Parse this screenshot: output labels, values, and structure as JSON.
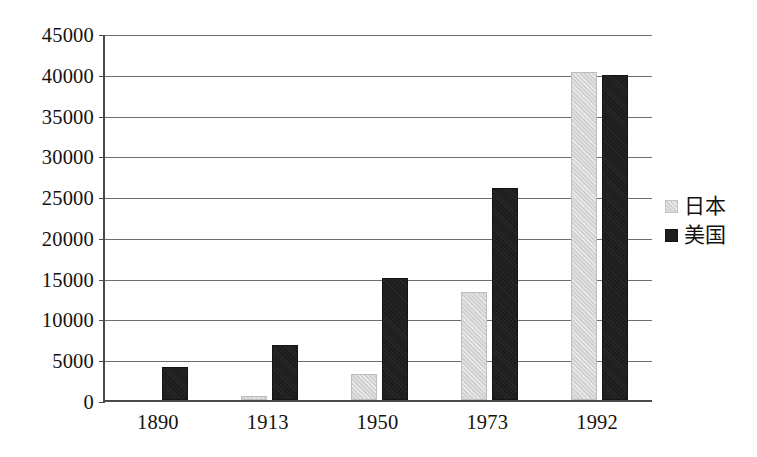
{
  "chart_data": {
    "type": "bar",
    "title": "",
    "subtitle": "",
    "xlabel": "",
    "ylabel": "",
    "categories": [
      "1890",
      "1913",
      "1950",
      "1973",
      "1992"
    ],
    "series": [
      {
        "name": "日本",
        "color": "#d2d2d2",
        "values": [
          0,
          500,
          3200,
          13300,
          40200
        ]
      },
      {
        "name": "美国",
        "color": "#1d1d1d",
        "values": [
          4000,
          6700,
          15000,
          26000,
          39800
        ]
      }
    ],
    "ylim": [
      0,
      45000
    ],
    "ytick_step": 5000,
    "yticks": [
      "0",
      "5000",
      "10000",
      "15000",
      "20000",
      "25000",
      "30000",
      "35000",
      "40000",
      "45000"
    ],
    "ytick_values": [
      0,
      5000,
      10000,
      15000,
      20000,
      25000,
      30000,
      35000,
      40000,
      45000
    ],
    "grid": true,
    "grid_axis": "y",
    "legend_position": "right",
    "background_color": "#ffffff",
    "axis_color": "#4a4a4a",
    "grid_color": "#6e6e6e"
  },
  "axes": {
    "y_labels": [
      "45000",
      "40000",
      "35000",
      "30000",
      "25000",
      "20000",
      "15000",
      "10000",
      "5000",
      "0"
    ],
    "x_labels": [
      "1890",
      "1913",
      "1950",
      "1973",
      "1992"
    ]
  },
  "legend": {
    "items": [
      {
        "label": "日本",
        "swatch": "japan"
      },
      {
        "label": "美国",
        "swatch": "usa"
      }
    ]
  }
}
